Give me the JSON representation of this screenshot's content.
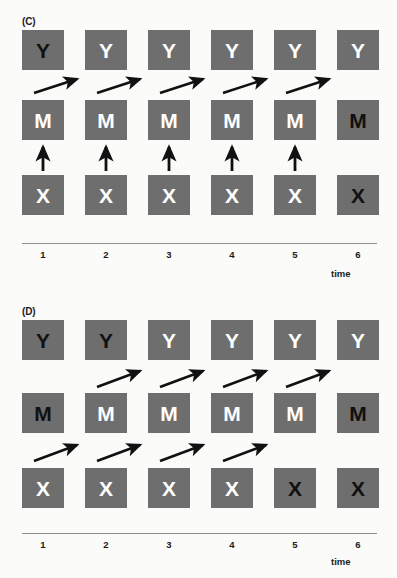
{
  "figure": {
    "background_color": "#fbfbf9",
    "box_color": "#6e6e6e",
    "label_light_color": "#ffffff",
    "label_dark_color": "#111111",
    "arrow_color": "#111111",
    "axis_color": "#8e8e8e"
  },
  "panels": [
    {
      "id": "C",
      "label": "(C)",
      "rows": [
        {
          "name": "Y",
          "nodes": [
            {
              "label": "Y",
              "shade": "dark"
            },
            {
              "label": "Y",
              "shade": "light"
            },
            {
              "label": "Y",
              "shade": "light"
            },
            {
              "label": "Y",
              "shade": "light"
            },
            {
              "label": "Y",
              "shade": "light"
            },
            {
              "label": "Y",
              "shade": "light"
            }
          ]
        },
        {
          "name": "M",
          "nodes": [
            {
              "label": "M",
              "shade": "light"
            },
            {
              "label": "M",
              "shade": "light"
            },
            {
              "label": "M",
              "shade": "light"
            },
            {
              "label": "M",
              "shade": "light"
            },
            {
              "label": "M",
              "shade": "light"
            },
            {
              "label": "M",
              "shade": "dark"
            }
          ]
        },
        {
          "name": "X",
          "nodes": [
            {
              "label": "X",
              "shade": "light"
            },
            {
              "label": "X",
              "shade": "light"
            },
            {
              "label": "X",
              "shade": "light"
            },
            {
              "label": "X",
              "shade": "light"
            },
            {
              "label": "X",
              "shade": "light"
            },
            {
              "label": "X",
              "shade": "dark"
            }
          ]
        }
      ],
      "arrows_diagonal_M_to_Y": [
        {
          "from_col": 1,
          "to_col": 2
        },
        {
          "from_col": 2,
          "to_col": 3
        },
        {
          "from_col": 3,
          "to_col": 4
        },
        {
          "from_col": 4,
          "to_col": 5
        },
        {
          "from_col": 5,
          "to_col": 6
        }
      ],
      "arrows_vertical_X_to_M": [
        1,
        2,
        3,
        4,
        5
      ],
      "arrows_diagonal_X_to_M": [],
      "axis": {
        "ticks": [
          "1",
          "2",
          "3",
          "4",
          "5",
          "6"
        ],
        "title": "time"
      }
    },
    {
      "id": "D",
      "label": "(D)",
      "rows": [
        {
          "name": "Y",
          "nodes": [
            {
              "label": "Y",
              "shade": "dark"
            },
            {
              "label": "Y",
              "shade": "dark"
            },
            {
              "label": "Y",
              "shade": "light"
            },
            {
              "label": "Y",
              "shade": "light"
            },
            {
              "label": "Y",
              "shade": "light"
            },
            {
              "label": "Y",
              "shade": "light"
            }
          ]
        },
        {
          "name": "M",
          "nodes": [
            {
              "label": "M",
              "shade": "dark"
            },
            {
              "label": "M",
              "shade": "light"
            },
            {
              "label": "M",
              "shade": "light"
            },
            {
              "label": "M",
              "shade": "light"
            },
            {
              "label": "M",
              "shade": "light"
            },
            {
              "label": "M",
              "shade": "dark"
            }
          ]
        },
        {
          "name": "X",
          "nodes": [
            {
              "label": "X",
              "shade": "light"
            },
            {
              "label": "X",
              "shade": "light"
            },
            {
              "label": "X",
              "shade": "light"
            },
            {
              "label": "X",
              "shade": "light"
            },
            {
              "label": "X",
              "shade": "dark"
            },
            {
              "label": "X",
              "shade": "dark"
            }
          ]
        }
      ],
      "arrows_diagonal_M_to_Y": [
        {
          "from_col": 2,
          "to_col": 3
        },
        {
          "from_col": 3,
          "to_col": 4
        },
        {
          "from_col": 4,
          "to_col": 5
        },
        {
          "from_col": 5,
          "to_col": 6
        }
      ],
      "arrows_vertical_X_to_M": [],
      "arrows_diagonal_X_to_M": [
        {
          "from_col": 1,
          "to_col": 2
        },
        {
          "from_col": 2,
          "to_col": 3
        },
        {
          "from_col": 3,
          "to_col": 4
        },
        {
          "from_col": 4,
          "to_col": 5
        }
      ],
      "axis": {
        "ticks": [
          "1",
          "2",
          "3",
          "4",
          "5",
          "6"
        ],
        "title": "time"
      }
    }
  ]
}
